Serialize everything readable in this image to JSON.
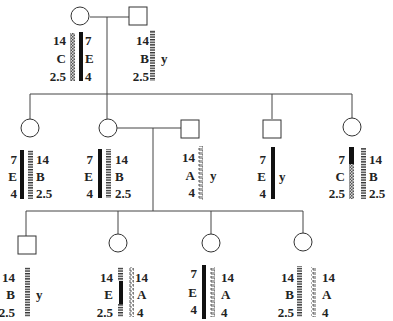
{
  "diagram": {
    "type": "pedigree-with-haplotypes",
    "legend_note": "Chromosome bars show marker alleles at three loci (top/middle/bottom); 'y' marks the Y chromosome in males",
    "colors": {
      "line": "#444444",
      "solid": "#111111",
      "text": "#222222"
    },
    "pattern_types": [
      "solid-black",
      "checkered",
      "striped",
      "wavy"
    ],
    "generation_1": {
      "female": {
        "sex": "female",
        "chromosomes": [
          {
            "pattern": "checkered",
            "alleles": [
              "14",
              "C",
              "2.5"
            ],
            "label_side": "left"
          },
          {
            "pattern": "solid-black",
            "alleles": [
              "7",
              "E",
              "4"
            ],
            "label_side": "right"
          }
        ]
      },
      "male": {
        "sex": "male",
        "chromosomes": [
          {
            "pattern": "striped",
            "alleles": [
              "14",
              "B",
              "2.5"
            ],
            "label_side": "left"
          }
        ],
        "y_label": "y"
      }
    },
    "generation_2": [
      {
        "sex": "female",
        "chromosomes": [
          {
            "pattern": "solid-black",
            "alleles": [
              "7",
              "E",
              "4"
            ],
            "label_side": "left"
          },
          {
            "pattern": "striped",
            "alleles": [
              "14",
              "B",
              "2.5"
            ],
            "label_side": "right"
          }
        ]
      },
      {
        "sex": "female",
        "chromosomes": [
          {
            "pattern": "solid-black",
            "alleles": [
              "7",
              "E",
              "4"
            ],
            "label_side": "left"
          },
          {
            "pattern": "striped",
            "alleles": [
              "14",
              "B",
              "2.5"
            ],
            "label_side": "right"
          }
        ]
      },
      {
        "sex": "male",
        "married_in": true,
        "chromosomes": [
          {
            "pattern": "wavy",
            "alleles": [
              "14",
              "A",
              "4"
            ],
            "label_side": "left"
          }
        ],
        "y_label": "y"
      },
      {
        "sex": "male",
        "chromosomes": [
          {
            "pattern": "solid-black",
            "alleles": [
              "7",
              "E",
              "4"
            ],
            "label_side": "left"
          }
        ],
        "y_label": "y"
      },
      {
        "sex": "female",
        "chromosomes": [
          {
            "pattern": "recombinant: solid-black top, checkered bottom",
            "alleles": [
              "7",
              "C",
              "2.5"
            ],
            "label_side": "left"
          },
          {
            "pattern": "striped",
            "alleles": [
              "14",
              "B",
              "2.5"
            ],
            "label_side": "right"
          }
        ]
      }
    ],
    "generation_3": [
      {
        "sex": "male",
        "chromosomes": [
          {
            "pattern": "striped",
            "alleles": [
              "14",
              "B",
              "2.5"
            ],
            "label_side": "left"
          }
        ],
        "y_label": "y"
      },
      {
        "sex": "female",
        "chromosomes": [
          {
            "pattern": "recombinant: striped top, solid-black middle, striped bottom",
            "alleles": [
              "14",
              "E",
              "2.5"
            ],
            "label_side": "left"
          },
          {
            "pattern": "wavy",
            "alleles": [
              "14",
              "A",
              "4"
            ],
            "label_side": "right"
          }
        ]
      },
      {
        "sex": "female",
        "chromosomes": [
          {
            "pattern": "solid-black",
            "alleles": [
              "7",
              "E",
              "4"
            ],
            "label_side": "left"
          },
          {
            "pattern": "wavy",
            "alleles": [
              "14",
              "A",
              "4"
            ],
            "label_side": "right"
          }
        ]
      },
      {
        "sex": "female",
        "chromosomes": [
          {
            "pattern": "striped",
            "alleles": [
              "14",
              "B",
              "2.5"
            ],
            "label_side": "left"
          },
          {
            "pattern": "wavy",
            "alleles": [
              "14",
              "A",
              "4"
            ],
            "label_side": "right"
          }
        ]
      }
    ],
    "labels": {
      "g1f_l": [
        "14",
        "C",
        "2.5"
      ],
      "g1f_r": [
        "7",
        "E",
        "4"
      ],
      "g1m_l": [
        "14",
        "B",
        "2.5"
      ],
      "y": "y",
      "g2a_l": [
        "7",
        "E",
        "4"
      ],
      "g2a_r": [
        "14",
        "B",
        "2.5"
      ],
      "g2b_l": [
        "7",
        "E",
        "4"
      ],
      "g2b_r": [
        "14",
        "B",
        "2.5"
      ],
      "g2c_l": [
        "14",
        "A",
        "4"
      ],
      "g2d_l": [
        "7",
        "E",
        "4"
      ],
      "g2e_l": [
        "7",
        "C",
        "2.5"
      ],
      "g2e_r": [
        "14",
        "B",
        "2.5"
      ],
      "g3a_l": [
        "14",
        "B",
        "2.5"
      ],
      "g3b_l": [
        "14",
        "E",
        "2.5"
      ],
      "g3b_r": [
        "14",
        "A",
        "4"
      ],
      "g3c_l": [
        "7",
        "E",
        "4"
      ],
      "g3c_r": [
        "14",
        "A",
        "4"
      ],
      "g3d_l": [
        "14",
        "B",
        "2.5"
      ],
      "g3d_r": [
        "14",
        "A",
        "4"
      ]
    }
  }
}
